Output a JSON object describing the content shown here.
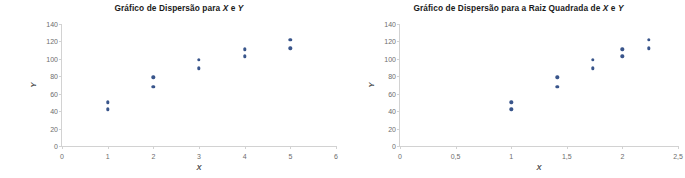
{
  "page": {
    "background_color": "#ffffff",
    "marker_color": "#39558b",
    "axis_color": "#d2d2d2",
    "tick_label_color": "#6d6d6d"
  },
  "decoration": {
    "edge_bar_name": "left-margin-strip",
    "colors": [
      "#8e4f2e",
      "#c07a4f",
      "#e2c9a0",
      "#d9dcc0",
      "#a75f38"
    ]
  },
  "chart_data": [
    {
      "id": "scatter-x-y",
      "type": "scatter",
      "title": "Gráfico de Dispersão para X e Y",
      "title_parts": {
        "before": "Gráfico de Dispersão para ",
        "italic1": "X",
        "middle": " e ",
        "italic2": "Y"
      },
      "xlabel": "X",
      "ylabel": "Y",
      "xlim": [
        0,
        6
      ],
      "ylim": [
        0,
        140
      ],
      "xticks": [
        "0",
        "1",
        "2",
        "3",
        "4",
        "5",
        "6"
      ],
      "xtick_values": [
        0,
        1,
        2,
        3,
        4,
        5,
        6
      ],
      "yticks": [
        "0",
        "20",
        "40",
        "60",
        "80",
        "100",
        "120",
        "140"
      ],
      "ytick_values": [
        0,
        20,
        40,
        60,
        80,
        100,
        120,
        140
      ],
      "grid": false,
      "legend": false,
      "points": [
        {
          "x": 1,
          "y": 50
        },
        {
          "x": 1,
          "y": 42
        },
        {
          "x": 2,
          "y": 79
        },
        {
          "x": 2,
          "y": 68
        },
        {
          "x": 3,
          "y": 99
        },
        {
          "x": 3,
          "y": 89
        },
        {
          "x": 4,
          "y": 111
        },
        {
          "x": 4,
          "y": 103
        },
        {
          "x": 5,
          "y": 122
        },
        {
          "x": 5,
          "y": 112
        }
      ]
    },
    {
      "id": "scatter-sqrt-x-y",
      "type": "scatter",
      "title": "Gráfico de Dispersão para a Raiz Quadrada de X e Y",
      "title_parts": {
        "before": "Gráfico de Dispersão para a Raiz Quadrada de ",
        "italic1": "X",
        "middle": " e ",
        "italic2": "Y"
      },
      "xlabel": "X",
      "ylabel": "Y",
      "xlim": [
        0,
        2.5
      ],
      "ylim": [
        0,
        140
      ],
      "xticks": [
        "0",
        "0,5",
        "1",
        "1,5",
        "2",
        "2,5"
      ],
      "xtick_values": [
        0,
        0.5,
        1,
        1.5,
        2,
        2.5
      ],
      "yticks": [
        "0",
        "20",
        "40",
        "60",
        "80",
        "100",
        "120",
        "140"
      ],
      "ytick_values": [
        0,
        20,
        40,
        60,
        80,
        100,
        120,
        140
      ],
      "grid": false,
      "legend": false,
      "points": [
        {
          "x": 1.0,
          "y": 50
        },
        {
          "x": 1.0,
          "y": 42
        },
        {
          "x": 1.414,
          "y": 79
        },
        {
          "x": 1.414,
          "y": 68
        },
        {
          "x": 1.732,
          "y": 99
        },
        {
          "x": 1.732,
          "y": 89
        },
        {
          "x": 2.0,
          "y": 111
        },
        {
          "x": 2.0,
          "y": 103
        },
        {
          "x": 2.236,
          "y": 122
        },
        {
          "x": 2.236,
          "y": 112
        }
      ]
    }
  ]
}
